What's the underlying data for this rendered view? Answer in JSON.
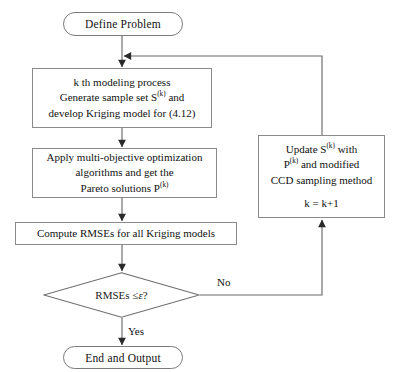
{
  "diagram": {
    "width": 393,
    "height": 372,
    "line_color": "#6b6b6b",
    "text_color": "#111111",
    "background": "#ffffff"
  },
  "nodes": {
    "start": {
      "shape": "terminator",
      "label": "Define Problem"
    },
    "modeling": {
      "shape": "process",
      "line1": "k th modeling process",
      "line2_a": "Generate sample set S",
      "line2_sup": "(k)",
      "line2_b": " and",
      "line3": "develop Kriging model for (4.12)"
    },
    "optimize": {
      "shape": "process",
      "line1": "Apply multi-objective optimization",
      "line2": "algorithms and get the",
      "line3_a": "Pareto solutions P",
      "line3_sup": "(k)"
    },
    "rmse": {
      "shape": "process",
      "label": "Compute RMSEs for all Kriging models"
    },
    "decision": {
      "shape": "diamond",
      "label_a": "RMSEs ≤ ",
      "label_eps": "ε",
      "label_b": " ?"
    },
    "update": {
      "shape": "process",
      "line1_a": "Update S",
      "line1_sup": "(k)",
      "line1_b": " with",
      "line2_a": "P",
      "line2_sup": "(k)",
      "line2_b": " and modified",
      "line3": "CCD sampling method",
      "line4": "k = k+1"
    },
    "end": {
      "shape": "terminator",
      "label": "End and Output"
    }
  },
  "edges": {
    "yes_label": "Yes",
    "no_label": "No"
  }
}
